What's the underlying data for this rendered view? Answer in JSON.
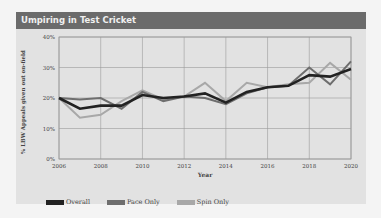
{
  "header": {
    "title": "Umpiring in Test Cricket"
  },
  "colors": {
    "overall": "#222222",
    "pace": "#6e6e6e",
    "spin": "#a8a8a8",
    "header_bg": "#6b6b6b",
    "card_bg": "#e2e2e2",
    "grid": "#9a9a9a"
  },
  "legend": [
    {
      "label": "Overall",
      "series": "overall"
    },
    {
      "label": "Pace Only",
      "series": "pace"
    },
    {
      "label": "Spin Only",
      "series": "spin"
    }
  ],
  "chart_data": {
    "type": "line",
    "title": "Umpiring in Test Cricket",
    "xlabel": "Year",
    "ylabel": "% LBW Appeals given out on-field",
    "x": [
      2006,
      2007,
      2008,
      2009,
      2010,
      2011,
      2012,
      2013,
      2014,
      2015,
      2016,
      2017,
      2018,
      2019,
      2020
    ],
    "x_ticks": [
      "2006",
      "2008",
      "2010",
      "2012",
      "2014",
      "2016",
      "2018",
      "2020"
    ],
    "y_ticks": [
      "0%",
      "10%",
      "20%",
      "30%",
      "40%"
    ],
    "ylim": [
      0,
      40
    ],
    "xlim": [
      2006,
      2020
    ],
    "grid": true,
    "legend_position": "bottom-left",
    "series": [
      {
        "name": "Overall",
        "values": [
          20,
          16.5,
          17.5,
          17.5,
          21,
          20,
          20.5,
          21.5,
          18.5,
          22,
          23.5,
          24,
          27.5,
          27,
          29.5
        ]
      },
      {
        "name": "Pace Only",
        "values": [
          20,
          19.5,
          20,
          16.5,
          22,
          19,
          20.5,
          20,
          18,
          21.5,
          23.5,
          24,
          30,
          24.5,
          32
        ]
      },
      {
        "name": "Spin Only",
        "values": [
          20,
          13.5,
          14.5,
          19,
          22.5,
          19.5,
          20.5,
          25,
          19,
          25,
          23.5,
          24.5,
          25,
          31.5,
          26
        ]
      }
    ]
  }
}
